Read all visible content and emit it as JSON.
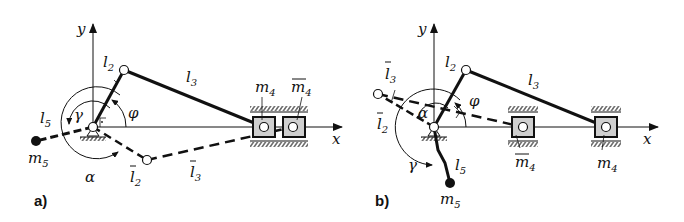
{
  "figure": {
    "panels": [
      {
        "id": "a",
        "panel_label": "a)",
        "labels": {
          "y_axis": "y",
          "x_axis": "x",
          "l2": "l",
          "l2_sub": "2",
          "l3": "l",
          "l3_sub": "3",
          "l2_bar": "l",
          "l2_bar_sub": "2",
          "l3_bar": "l",
          "l3_bar_sub": "3",
          "l5": "l",
          "l5_sub": "5",
          "m4": "m",
          "m4_sub": "4",
          "m4_bar": "m",
          "m4_bar_sub": "4",
          "m5": "m",
          "m5_sub": "5",
          "phi": "φ",
          "gamma": "γ",
          "alpha": "α"
        }
      },
      {
        "id": "b",
        "panel_label": "b)",
        "labels": {
          "y_axis": "y",
          "x_axis": "x",
          "l2": "l",
          "l2_sub": "2",
          "l3": "l",
          "l3_sub": "3",
          "l2_bar": "l",
          "l2_bar_sub": "2",
          "l3_bar": "l",
          "l3_bar_sub": "3",
          "l5": "l",
          "l5_sub": "5",
          "m4": "m",
          "m4_sub": "4",
          "m4_bar": "m",
          "m4_bar_sub": "4",
          "m5": "m",
          "m5_sub": "5",
          "phi": "φ",
          "gamma": "γ",
          "alpha": "α"
        }
      }
    ],
    "colors": {
      "ink": "#111111",
      "slider_fill": "#cfcfcf",
      "background": "#ffffff"
    }
  }
}
